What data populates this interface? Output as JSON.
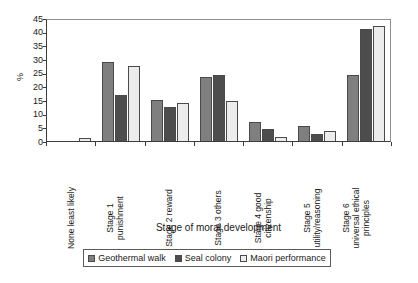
{
  "chart_data": {
    "type": "bar",
    "title": "",
    "xlabel": "Stage of moral development",
    "ylabel": "%",
    "ylim": [
      0,
      45
    ],
    "yticks": [
      0,
      5,
      10,
      15,
      20,
      25,
      30,
      35,
      40,
      45
    ],
    "grid": false,
    "legend_position": "bottom",
    "categories": [
      "None least likely",
      "Stage 1 punishment",
      "Stage 2 reward",
      "Stage 3 others",
      "Stage 4 good citizenship",
      "Stage 5 utility/reasoning",
      "Stage 6 universal ethical principles"
    ],
    "category_lines": [
      [
        "None least likely"
      ],
      [
        "Stage 1",
        "punishment"
      ],
      [
        "Stage 2 reward"
      ],
      [
        "Stage 3 others"
      ],
      [
        "Stage 4 good",
        "citizenship"
      ],
      [
        "Stage 5",
        "utility/reasoning"
      ],
      [
        "Stage 6",
        "universal ethical",
        "principles"
      ]
    ],
    "series": [
      {
        "name": "Geothermal walk",
        "color": "#7f7f7f",
        "values": [
          0,
          29,
          15,
          23.5,
          7,
          5.5,
          24
        ]
      },
      {
        "name": "Seal colony",
        "color": "#4d4d4d",
        "values": [
          0,
          17,
          12.5,
          24,
          4.5,
          2.5,
          41
        ]
      },
      {
        "name": "Maori performance",
        "color": "#ececec",
        "values": [
          1,
          27.5,
          14,
          14.5,
          1.5,
          3.5,
          42
        ]
      }
    ]
  },
  "legend": {
    "items": [
      {
        "label": "Geothermal walk"
      },
      {
        "label": "Seal colony"
      },
      {
        "label": "Maori performance"
      }
    ]
  },
  "axis": {
    "y_title": "%",
    "x_title": "Stage of moral development"
  }
}
